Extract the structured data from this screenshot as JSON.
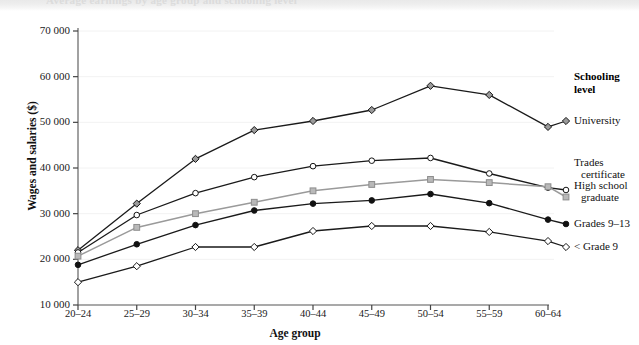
{
  "figure": {
    "title_remnant": "Average earnings by age group and schooling level",
    "axis": {
      "ylabel": "Wages and salaries ($)",
      "xlabel": "Age group",
      "yticks": [
        "70 000",
        "60 000",
        "50 000",
        "40 000",
        "30 000",
        "20 000",
        "10 000"
      ],
      "xticks": [
        "20–24",
        "25–29",
        "30–34",
        "35–39",
        "40–44",
        "45–49",
        "50–54",
        "55–59",
        "60–64"
      ]
    },
    "legend": {
      "title_line1": "Schooling",
      "title_line2": "level",
      "items": [
        {
          "label": "University",
          "marker": "diamond-gray"
        },
        {
          "label": "Trades",
          "label2": "certificate",
          "marker": "circle-open"
        },
        {
          "label": "High school",
          "label2": "graduate",
          "marker": "square-gray"
        },
        {
          "label": "Grades 9–13",
          "marker": "circle-filled"
        },
        {
          "label": "< Grade 9",
          "marker": "diamond-open"
        }
      ]
    }
  },
  "chart_data": {
    "type": "line",
    "title": "Average earnings by age group and schooling level",
    "xlabel": "Age group",
    "ylabel": "Wages and salaries ($)",
    "categories": [
      "20–24",
      "25–29",
      "30–34",
      "35–39",
      "40–44",
      "45–49",
      "50–54",
      "55–59",
      "60–64"
    ],
    "ylim": [
      10000,
      70000
    ],
    "ytick_step": 10000,
    "grid": false,
    "legend_position": "right",
    "series": [
      {
        "name": "University",
        "color": "#1a1a1a",
        "marker": "diamond",
        "marker_fill": "#9a9a9a",
        "values": [
          22000,
          32200,
          42000,
          48300,
          50300,
          52700,
          58000,
          56000,
          49000
        ]
      },
      {
        "name": "Trades certificate",
        "color": "#1a1a1a",
        "marker": "circle",
        "marker_fill": "#ffffff",
        "values": [
          21500,
          29700,
          34500,
          38000,
          40400,
          41600,
          42200,
          38800,
          35700
        ]
      },
      {
        "name": "High school graduate",
        "color": "#9a9a9a",
        "marker": "square",
        "marker_fill": "#b9b9b9",
        "values": [
          20700,
          27000,
          30000,
          32500,
          35000,
          36400,
          37500,
          36800,
          35900
        ]
      },
      {
        "name": "Grades 9–13",
        "color": "#1a1a1a",
        "marker": "circle",
        "marker_fill": "#111111",
        "values": [
          18800,
          23300,
          27500,
          30700,
          32200,
          32900,
          34300,
          32300,
          28700
        ]
      },
      {
        "name": "< Grade 9",
        "color": "#1a1a1a",
        "marker": "diamond",
        "marker_fill": "#ffffff",
        "values": [
          15000,
          18500,
          22700,
          22700,
          26200,
          27300,
          27300,
          26000,
          24000
        ]
      }
    ]
  }
}
